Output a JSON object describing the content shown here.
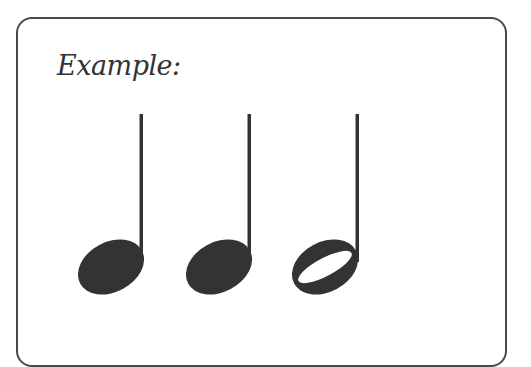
{
  "header_fragment": "",
  "example": {
    "label": "Example:",
    "notes": [
      {
        "type": "quarter-note",
        "filled": true
      },
      {
        "type": "quarter-note",
        "filled": true
      },
      {
        "type": "half-note",
        "filled": false
      }
    ]
  },
  "colors": {
    "ink": "#333333",
    "border": "#4a4a4a"
  }
}
